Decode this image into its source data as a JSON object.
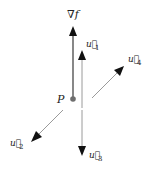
{
  "diagram": {
    "point": {
      "label": "P",
      "color": "#6e6e6e"
    },
    "gradient": {
      "label": "∇f",
      "color": "#6a6a6a"
    },
    "vectors": [
      {
        "name": "u1",
        "label": "u⃗",
        "subscript": "1",
        "direction": "up"
      },
      {
        "name": "u2",
        "label": "u⃗",
        "subscript": "2",
        "direction": "down-left"
      },
      {
        "name": "u3",
        "label": "u⃗",
        "subscript": "3",
        "direction": "down"
      },
      {
        "name": "u4",
        "label": "u⃗",
        "subscript": "4",
        "direction": "up-right"
      }
    ],
    "vector_color": "#9a9a9a",
    "arrowhead_color": "#111111"
  }
}
